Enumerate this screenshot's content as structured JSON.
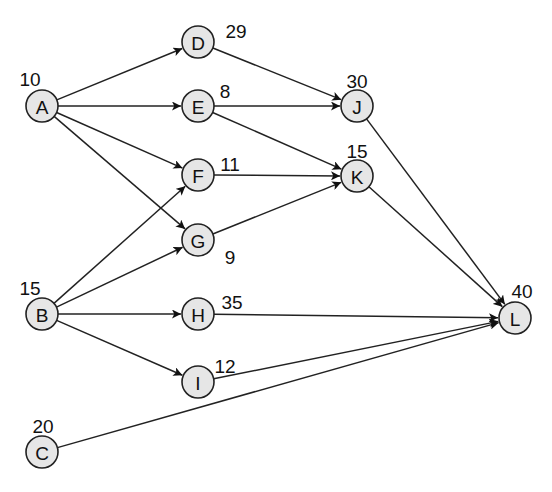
{
  "diagram": {
    "type": "activity-on-node network",
    "nodes": [
      {
        "id": "A",
        "label": "A",
        "duration": "10",
        "x": 42,
        "y": 106,
        "lx": 30,
        "ly": 79
      },
      {
        "id": "B",
        "label": "B",
        "duration": "15",
        "x": 42,
        "y": 314,
        "lx": 30,
        "ly": 288
      },
      {
        "id": "C",
        "label": "C",
        "duration": "20",
        "x": 42,
        "y": 452,
        "lx": 43,
        "ly": 426
      },
      {
        "id": "D",
        "label": "D",
        "duration": "29",
        "x": 198,
        "y": 42,
        "lx": 236,
        "ly": 31
      },
      {
        "id": "E",
        "label": "E",
        "duration": "8",
        "x": 198,
        "y": 106,
        "lx": 225,
        "ly": 91
      },
      {
        "id": "F",
        "label": "F",
        "duration": "11",
        "x": 198,
        "y": 175,
        "lx": 230,
        "ly": 164
      },
      {
        "id": "G",
        "label": "G",
        "duration": "9",
        "x": 198,
        "y": 240,
        "lx": 230,
        "ly": 257
      },
      {
        "id": "H",
        "label": "H",
        "duration": "35",
        "x": 198,
        "y": 314,
        "lx": 232,
        "ly": 302
      },
      {
        "id": "I",
        "label": "I",
        "duration": "12",
        "x": 198,
        "y": 382,
        "lx": 225,
        "ly": 366
      },
      {
        "id": "J",
        "label": "J",
        "duration": "30",
        "x": 357,
        "y": 106,
        "lx": 357,
        "ly": 81
      },
      {
        "id": "K",
        "label": "K",
        "duration": "15",
        "x": 357,
        "y": 176,
        "lx": 357,
        "ly": 151
      },
      {
        "id": "L",
        "label": "L",
        "duration": "40",
        "x": 515,
        "y": 318,
        "lx": 522,
        "ly": 291
      }
    ],
    "edges": [
      [
        "A",
        "D"
      ],
      [
        "A",
        "E"
      ],
      [
        "A",
        "F"
      ],
      [
        "A",
        "G"
      ],
      [
        "B",
        "F"
      ],
      [
        "B",
        "G"
      ],
      [
        "B",
        "H"
      ],
      [
        "B",
        "I"
      ],
      [
        "C",
        "L"
      ],
      [
        "D",
        "J"
      ],
      [
        "E",
        "J"
      ],
      [
        "E",
        "K"
      ],
      [
        "F",
        "K"
      ],
      [
        "G",
        "K"
      ],
      [
        "H",
        "L"
      ],
      [
        "I",
        "L"
      ],
      [
        "J",
        "L"
      ],
      [
        "K",
        "L"
      ]
    ],
    "node_radius": 16,
    "colors": {
      "node_fill": "#e6e6e6",
      "stroke": "#222222"
    }
  }
}
